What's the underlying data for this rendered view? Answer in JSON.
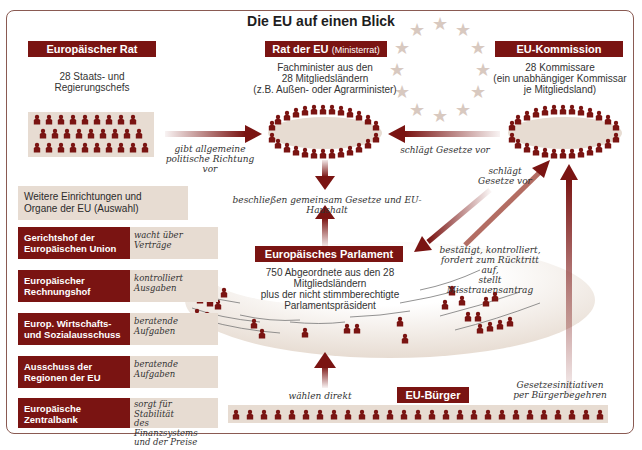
{
  "title": "Die EU auf einen Blick",
  "colors": {
    "accent": "#7a1412",
    "panel": "#e7dcd2",
    "star": "#d8c9c0",
    "frame": "#8a5a52"
  },
  "council": {
    "label": "Europäischer Rat",
    "desc_1": "28 Staats- und",
    "desc_2": "Regierungschefs",
    "members": 28
  },
  "council_eu": {
    "label": "Rat der EU",
    "label_sub": "(Ministerrat)",
    "desc_1": "Fachminister aus den",
    "desc_2": "28 Mitgliedsländern",
    "desc_3": "(z.B. Außen- oder Agrarminister)"
  },
  "commission": {
    "label": "EU-Kommission",
    "desc_1": "28 Kommissare",
    "desc_2": "(ein unabhängiger Kommissar",
    "desc_3": "je Mitgliedsland)"
  },
  "parliament": {
    "label": "Europäisches Parlament",
    "desc_1": "750 Abgeordnete aus den 28 Mitgliedsländern",
    "desc_2": "plus der nicht stimmberechtigte",
    "desc_3": "Parlamentspräsident"
  },
  "citizens": {
    "label": "EU-Bürger",
    "count_icons": 27
  },
  "arrows": {
    "council_to_council_eu_1": "gibt allgemeine",
    "council_to_council_eu_2": "politische Richtung vor",
    "commission_to_council_eu": "schlägt Gesetze vor",
    "commission_to_parliament_1": "schlägt",
    "commission_to_parliament_2": "Gesetze vor",
    "joint": "beschließen gemeinsam Gesetze und EU-Haushalt",
    "parliament_to_commission_1": "bestätigt, kontrolliert,",
    "parliament_to_commission_2": "fordert zum Rücktritt auf,",
    "parliament_to_commission_3": "stellt Misstrauensantrag",
    "citizens_to_parliament": "wählen direkt",
    "citizens_to_commission_1": "Gesetzesinitiativen",
    "citizens_to_commission_2": "per Bürgerbegehren"
  },
  "institutions": {
    "heading_1": "Weitere Einrichtungen und",
    "heading_2": "Organe der EU (Auswahl)",
    "items": [
      {
        "name_1": "Gerichtshof der",
        "name_2": "Europäischen Union",
        "role_1": "wacht über",
        "role_2": "Verträge",
        "role_3": ""
      },
      {
        "name_1": "Europäischer",
        "name_2": "Rechnungshof",
        "role_1": "kontrolliert",
        "role_2": "Ausgaben",
        "role_3": ""
      },
      {
        "name_1": "Europ. Wirtschafts-",
        "name_2": "und Sozialausschuss",
        "role_1": "beratende",
        "role_2": "Aufgaben",
        "role_3": ""
      },
      {
        "name_1": "Ausschuss der",
        "name_2": "Regionen der EU",
        "role_1": "beratende",
        "role_2": "Aufgaben",
        "role_3": ""
      },
      {
        "name_1": "Europäische",
        "name_2": "Zentralbank",
        "role_1": "sorgt für Stabilität",
        "role_2": "des Finanzsystems",
        "role_3": "und der Preise"
      }
    ]
  }
}
